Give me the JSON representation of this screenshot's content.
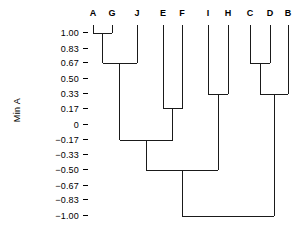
{
  "chart_data": {
    "type": "line",
    "subtype": "dendrogram",
    "title": "",
    "xlabel": "",
    "ylabel": "Min A",
    "ylim": [
      -1.0,
      1.0
    ],
    "grid": false,
    "legend": null,
    "orientation": "vertical-top-down",
    "leaves": [
      "A",
      "G",
      "J",
      "E",
      "F",
      "I",
      "H",
      "C",
      "D",
      "B"
    ],
    "leaf_x": [
      93,
      112,
      137,
      163,
      182,
      208,
      228,
      250,
      270,
      288
    ],
    "tick_labels": [
      "1.00",
      "0.83",
      "0.67",
      "0.50",
      "0.33",
      "0.17",
      "0",
      "−0.17",
      "−0.33",
      "−0.50",
      "−0.67",
      "−0.83",
      "−1.00"
    ],
    "tick_values": [
      1.0,
      0.83,
      0.67,
      0.5,
      0.33,
      0.17,
      0,
      -0.17,
      -0.33,
      -0.5,
      -0.67,
      -0.83,
      -1.0
    ],
    "merges": [
      {
        "id": "m1",
        "left": "A",
        "right": "G",
        "height": 1.0,
        "x": 102.5
      },
      {
        "id": "m2",
        "left": "m1",
        "right": "J",
        "height": 0.67,
        "x": 119.8
      },
      {
        "id": "m3",
        "left": "E",
        "right": "F",
        "height": 0.17,
        "x": 172.5
      },
      {
        "id": "m4",
        "left": "I",
        "right": "H",
        "height": 0.33,
        "x": 218.0
      },
      {
        "id": "m5",
        "left": "C",
        "right": "D",
        "height": 0.67,
        "x": 260.0
      },
      {
        "id": "m6",
        "left": "m5",
        "right": "B",
        "height": 0.33,
        "x": 274.0
      },
      {
        "id": "m7",
        "left": "m2",
        "right": "m3",
        "height": -0.17,
        "x": 146.2
      },
      {
        "id": "m8",
        "left": "m7",
        "right": "m4",
        "height": -0.5,
        "x": 182.1
      },
      {
        "id": "m9",
        "left": "m8",
        "right": "m6",
        "height": -1.0,
        "x": 228.0
      }
    ],
    "colors": {
      "line": "#1a1a1a",
      "background": "#ffffff",
      "text": "#000000"
    }
  },
  "axis": {
    "y_title": "Min A"
  }
}
